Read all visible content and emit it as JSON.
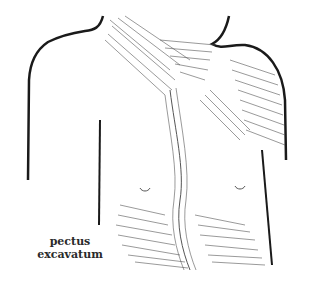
{
  "figure": {
    "caption_line1": "pectus",
    "caption_line2": "excavatum",
    "colors": {
      "ink": "#1a1a1a",
      "hatch": "#555555",
      "background": "#ffffff",
      "caption": "#2a2a2a"
    }
  }
}
